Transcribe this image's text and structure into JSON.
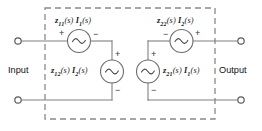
{
  "diagram": {
    "background_color": "#ffffff",
    "wire_color": "#808080",
    "dashed_box_color": "#8a8a8a"
  },
  "ports": {
    "input_label": "Input",
    "output_label": "Output"
  },
  "sources": [
    {
      "id": "source-z11",
      "equation_z": "z",
      "equation_z_sub": "11",
      "equation_mid": "(s) ",
      "equation_i": "I",
      "equation_i_sub": "1",
      "equation_tail": "(s)",
      "full_text": "z11(s) I1(s)",
      "orientation": "horizontal",
      "left_sign": "+",
      "right_sign": "−"
    },
    {
      "id": "source-z22",
      "equation_z": "z",
      "equation_z_sub": "22",
      "equation_mid": "(s) ",
      "equation_i": "I",
      "equation_i_sub": "2",
      "equation_tail": "(s)",
      "full_text": "z22(s) I2(s)",
      "orientation": "horizontal",
      "left_sign": "−",
      "right_sign": "+"
    },
    {
      "id": "source-z12",
      "equation_z": "z",
      "equation_z_sub": "12",
      "equation_mid": "(s) ",
      "equation_i": "I",
      "equation_i_sub": "2",
      "equation_tail": "(s)",
      "full_text": "z12(s) I2(s)",
      "orientation": "vertical",
      "top_sign": "+",
      "bottom_sign": "−"
    },
    {
      "id": "source-z21",
      "equation_z": "z",
      "equation_z_sub": "21",
      "equation_mid": "(s) ",
      "equation_i": "I",
      "equation_i_sub": "1",
      "equation_tail": "(s)",
      "full_text": "z21(s) I1(s)",
      "orientation": "vertical",
      "top_sign": "+",
      "bottom_sign": "−"
    }
  ],
  "signs": {
    "z11_left": "+",
    "z11_right": "−",
    "z22_left": "−",
    "z22_right": "+",
    "z12_top": "+",
    "z12_bottom": "−",
    "z21_top": "+",
    "z21_bottom": "−"
  },
  "terminals": [
    {
      "id": "input-top",
      "x": 18,
      "y": 41
    },
    {
      "id": "input-bottom",
      "x": 18,
      "y": 100
    },
    {
      "id": "output-top",
      "x": 241,
      "y": 41
    },
    {
      "id": "output-bottom",
      "x": 241,
      "y": 100
    }
  ]
}
